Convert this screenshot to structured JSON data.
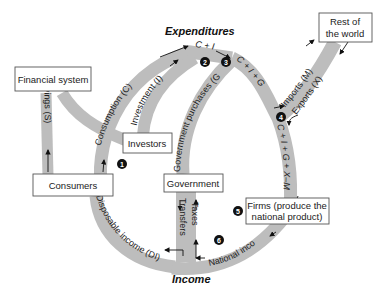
{
  "diagram": {
    "type": "circular-flow",
    "labels": {
      "top": "Expenditures",
      "bottom": "Income"
    },
    "boxes": {
      "financial_system": "Financial system",
      "consumers": "Consumers",
      "investors": "Investors",
      "government": "Government",
      "firms_line1": "Firms (produce the",
      "firms_line2": "national product)",
      "rest_world_line1": "Rest of",
      "rest_world_line2": "the world"
    },
    "flows": {
      "savings": "Savings (S)",
      "consumption": "Consumption (C)",
      "investment": "Investment (I)",
      "government_purchases": "Government purchases (G)",
      "c_plus_i": "C + I",
      "c_plus_i_plus_g": "C + I + G",
      "imports": "Imports (M)",
      "exports": "Exports (X)",
      "c_i_g_x_m": "C + I + G + X–M",
      "national_income": "National income",
      "taxes": "Taxes",
      "transfers": "Transfers",
      "disposable_income": "Disposable income (DI)"
    },
    "markers": [
      "1",
      "2",
      "3",
      "4",
      "5",
      "6"
    ],
    "colors": {
      "band": "#bdbdbd",
      "box_border": "#555555",
      "marker": "#111111"
    }
  }
}
